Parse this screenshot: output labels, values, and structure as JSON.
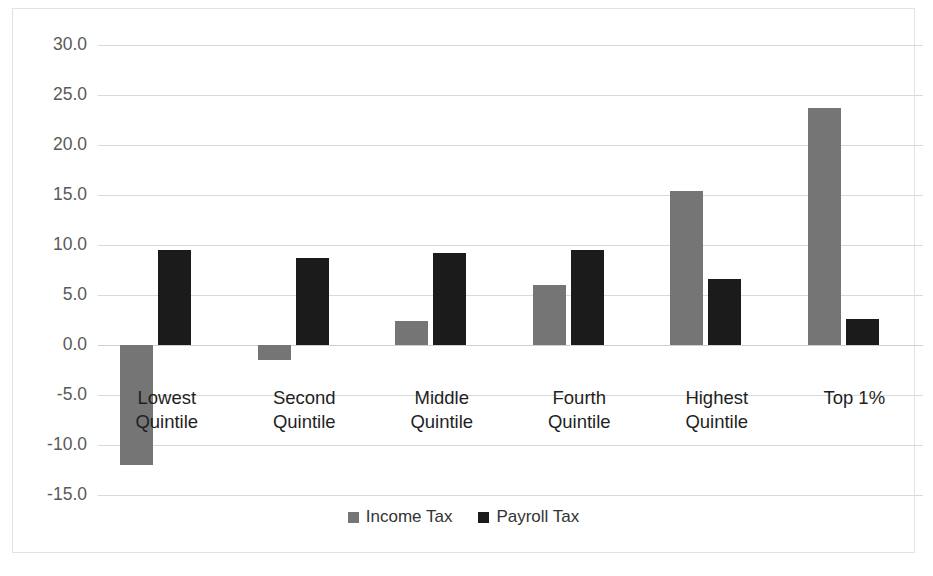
{
  "chart_data": {
    "type": "bar",
    "title": "",
    "subtitle": "",
    "xlabel": "",
    "ylabel": "",
    "grid": true,
    "legend_position": "bottom",
    "ylim": [
      -15.0,
      30.0
    ],
    "ytick_labels": [
      "30.0",
      "25.0",
      "20.0",
      "15.0",
      "10.0",
      "5.0",
      "0.0",
      "-5.0",
      "-10.0",
      "-15.0"
    ],
    "ytick_values": [
      30.0,
      25.0,
      20.0,
      15.0,
      10.0,
      5.0,
      0.0,
      -5.0,
      -10.0,
      -15.0
    ],
    "categories": [
      "Lowest\nQuintile",
      "Second\nQuintile",
      "Middle\nQuintile",
      "Fourth\nQuintile",
      "Highest\nQuintile",
      "Top 1%"
    ],
    "series": [
      {
        "name": "Income Tax",
        "color": "#757575",
        "values": [
          -12.0,
          -1.5,
          2.4,
          6.0,
          15.4,
          23.7
        ]
      },
      {
        "name": "Payroll Tax",
        "color": "#1b1b1b",
        "values": [
          9.5,
          8.7,
          9.2,
          9.5,
          6.6,
          2.6
        ]
      }
    ]
  },
  "legend": {
    "items": [
      {
        "label": "Income Tax",
        "swatch": "income"
      },
      {
        "label": "Payroll Tax",
        "swatch": "payroll"
      }
    ]
  }
}
